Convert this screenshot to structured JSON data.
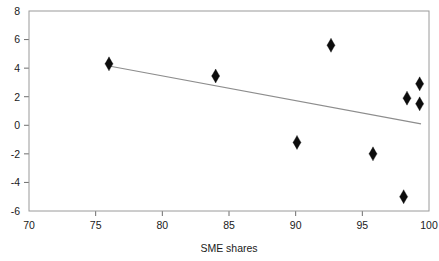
{
  "chart_data": {
    "type": "scatter",
    "title": "",
    "xlabel": "SME shares",
    "ylabel": "",
    "xlim": [
      70,
      100
    ],
    "ylim": [
      -6,
      8
    ],
    "xticks": [
      70,
      75,
      80,
      85,
      90,
      95,
      100
    ],
    "yticks": [
      -6,
      -4,
      -2,
      0,
      2,
      4,
      6,
      8
    ],
    "xtick_labels": [
      "70",
      "75",
      "80",
      "85",
      "90",
      "95",
      "100"
    ],
    "ytick_labels": [
      "-6",
      "-4",
      "-2",
      "0",
      "2",
      "4",
      "6",
      "8"
    ],
    "grid": false,
    "legend": null,
    "marker": "diamond",
    "marker_color": "#0d0d0d",
    "line_color": "#8d8d8d",
    "frame_color": "#9a9a9a",
    "points": [
      {
        "x": 76.0,
        "y": 4.3
      },
      {
        "x": 84.0,
        "y": 3.45
      },
      {
        "x": 90.1,
        "y": -1.2
      },
      {
        "x": 92.65,
        "y": 5.6
      },
      {
        "x": 95.8,
        "y": -2.0
      },
      {
        "x": 98.1,
        "y": -5.0
      },
      {
        "x": 98.35,
        "y": 1.9
      },
      {
        "x": 99.3,
        "y": 2.9
      },
      {
        "x": 99.3,
        "y": 1.5
      }
    ],
    "fit_line": {
      "name": "linear fit",
      "x": [
        76.0,
        99.4
      ],
      "y": [
        4.15,
        0.1
      ]
    }
  }
}
